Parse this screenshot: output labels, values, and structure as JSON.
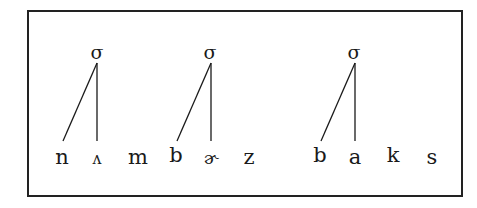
{
  "diagram": {
    "type": "syllable-structure",
    "node_label": "σ",
    "words": [
      {
        "text": "nʌmbɚz",
        "segments": [
          "n",
          "ʌ",
          "m",
          "b",
          "ɚ",
          "z"
        ]
      },
      {
        "text": "baks",
        "segments": [
          "b",
          "a",
          "k",
          "s"
        ]
      }
    ],
    "syllables": [
      {
        "label": "σ",
        "x": 97,
        "links": [
          {
            "segment": "n",
            "x": 62
          },
          {
            "segment": "ʌ",
            "x": 97
          }
        ]
      },
      {
        "label": "σ",
        "x": 210,
        "links": [
          {
            "segment": "b",
            "x": 177
          },
          {
            "segment": "ɚ",
            "x": 211
          }
        ]
      },
      {
        "label": "σ",
        "x": 354,
        "links": [
          {
            "segment": "b",
            "x": 320
          },
          {
            "segment": "a",
            "x": 355
          }
        ]
      }
    ],
    "segments": [
      {
        "char": "n",
        "x": 62
      },
      {
        "char": "ʌ",
        "x": 97
      },
      {
        "char": "m",
        "x": 138
      },
      {
        "char": "b",
        "x": 176
      },
      {
        "char": "ɚ",
        "x": 211
      },
      {
        "char": "z",
        "x": 249
      },
      {
        "char": "b",
        "x": 320
      },
      {
        "char": "a",
        "x": 355
      },
      {
        "char": "k",
        "x": 393
      },
      {
        "char": "s",
        "x": 432
      }
    ],
    "colors": {
      "ink": "#1a1a1a",
      "frame": "#222222",
      "background": "#ffffff"
    }
  }
}
